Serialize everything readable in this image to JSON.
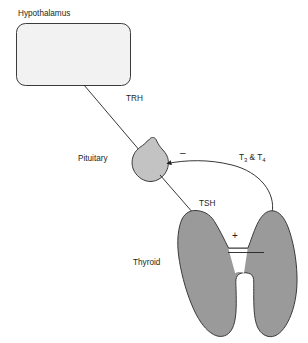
{
  "diagram": {
    "type": "flow-diagram",
    "background_color": "#ffffff",
    "nodes": [
      {
        "id": "hypothalamus",
        "label": "Hypothalamus",
        "shape": "rounded-rectangle",
        "fill_color": "#f2f2f2",
        "stroke_color": "#3b3b3b"
      },
      {
        "id": "pituitary",
        "label": "Pituitary",
        "shape": "pituitary-gland",
        "fill_color": "#c3c3c3",
        "stroke_color": "#3b3b3b"
      },
      {
        "id": "thyroid",
        "label": "Thyroid",
        "shape": "thyroid-gland",
        "fill_color": "#9a9a9a",
        "stroke_color": "#3b3b3b"
      }
    ],
    "edges": [
      {
        "id": "trh",
        "label": "TRH",
        "from": "hypothalamus",
        "to": "pituitary",
        "effect": "stimulates",
        "sign": ""
      },
      {
        "id": "tsh",
        "label": "TSH",
        "from": "pituitary",
        "to": "thyroid",
        "effect": "stimulates",
        "sign": "+"
      },
      {
        "id": "t3t4",
        "label_main": "T",
        "label_sub1": "3",
        "label_mid": " & T",
        "label_sub2": "4",
        "label_plain": "T3 & T4",
        "from": "thyroid",
        "to": "pituitary",
        "effect": "inhibits",
        "sign": "–"
      }
    ],
    "signs": {
      "negative": "–",
      "positive": "+"
    }
  }
}
